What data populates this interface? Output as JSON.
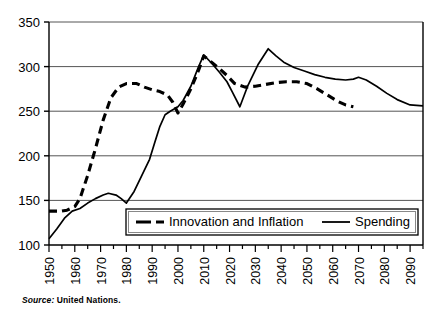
{
  "figure": {
    "source_prefix": "Source:",
    "source_text": "United Nations."
  },
  "chart_data": {
    "type": "line",
    "title": "",
    "xlabel": "",
    "ylabel": "",
    "xlim": [
      1950,
      2095
    ],
    "ylim": [
      100,
      350
    ],
    "ytick_step": 50,
    "xtick_step": 10,
    "xminor_step": 5,
    "grid": "horizontal",
    "legend_position": "inside-bottom-center",
    "yticks": [
      100,
      150,
      200,
      250,
      300,
      350
    ],
    "xticks": [
      1950,
      1960,
      1970,
      1980,
      1990,
      2000,
      2010,
      2020,
      2030,
      2040,
      2050,
      2060,
      2070,
      2080,
      2090
    ],
    "series": [
      {
        "name": "Innovation and Inflation",
        "style": "dashed",
        "color": "#000000",
        "x": [
          1950,
          1955,
          1957,
          1960,
          1962,
          1965,
          1968,
          1971,
          1974,
          1977,
          1980,
          1984,
          1987,
          1990,
          1993,
          1996,
          1998,
          2000,
          2002,
          2005,
          2008,
          2010,
          2013,
          2016,
          2019,
          2022,
          2026,
          2030,
          2034,
          2038,
          2042,
          2046,
          2050,
          2054,
          2058,
          2062,
          2065,
          2068
        ],
        "y": [
          138,
          138,
          139,
          143,
          152,
          178,
          208,
          240,
          265,
          277,
          281,
          281,
          277,
          274,
          272,
          268,
          260,
          248,
          258,
          275,
          296,
          312,
          305,
          298,
          290,
          281,
          277,
          278,
          280,
          282,
          283,
          283,
          281,
          275,
          268,
          261,
          257,
          255
        ]
      },
      {
        "name": "Spending",
        "style": "solid",
        "color": "#000000",
        "x": [
          1950,
          1953,
          1956,
          1959,
          1962,
          1965,
          1968,
          1971,
          1973,
          1976,
          1978,
          1980,
          1983,
          1986,
          1989,
          1991,
          1993,
          1995,
          1997,
          2000,
          2002,
          2005,
          2008,
          2010,
          2013,
          2016,
          2019,
          2021,
          2024,
          2027,
          2031,
          2035,
          2038,
          2041,
          2045,
          2049,
          2053,
          2057,
          2061,
          2065,
          2068,
          2070,
          2073,
          2077,
          2081,
          2085,
          2090,
          2095
        ],
        "y": [
          107,
          118,
          130,
          138,
          141,
          147,
          152,
          156,
          158,
          156,
          152,
          147,
          160,
          178,
          196,
          215,
          233,
          246,
          250,
          255,
          262,
          278,
          300,
          313,
          304,
          294,
          283,
          272,
          255,
          278,
          302,
          320,
          312,
          305,
          299,
          295,
          291,
          288,
          286,
          285,
          286,
          288,
          285,
          278,
          270,
          263,
          257,
          256
        ]
      }
    ]
  }
}
